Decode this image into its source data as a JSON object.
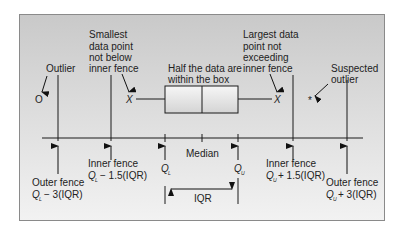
{
  "diagram": {
    "labels": {
      "outlier": "Outlier",
      "smallest": [
        "Smallest",
        "data point",
        "not below",
        "inner fence"
      ],
      "largest": [
        "Largest data",
        "point not",
        "exceeding",
        "inner fence"
      ],
      "half_data": [
        "Half the data are",
        "within the box"
      ],
      "suspected": [
        "Suspected",
        "outlier"
      ],
      "median": "Median",
      "iqr": "IQR",
      "q1": "Q",
      "q1_sub": "L",
      "q3": "Q",
      "q3_sub": "U",
      "inner_fence_left": [
        "Inner fence",
        "− 1.5(IQR)"
      ],
      "outer_fence_left": [
        "Outer fence",
        "− 3(IQR)"
      ],
      "inner_fence_right": [
        "Inner fence",
        "+ 1.5(IQR)"
      ],
      "outer_fence_right": [
        "Outer fence",
        "+ 3(IQR)"
      ]
    },
    "markers": {
      "outlier_symbol": "O",
      "whisker_end_symbol": "X",
      "suspected_symbol": "*"
    },
    "colors": {
      "line": "#1a1a1a",
      "box_fill_top": "#f4f4f4",
      "box_fill_bottom": "#d8d8d8"
    }
  }
}
